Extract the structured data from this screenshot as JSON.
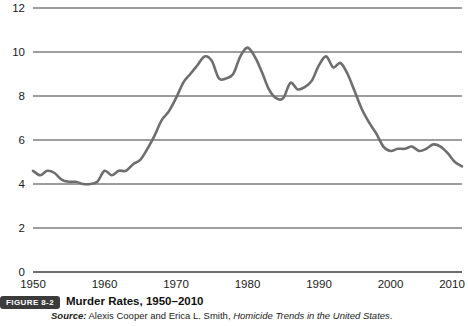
{
  "figure": {
    "badge": "FIGURE 8-2",
    "title": "Murder Rates, 1950–2010",
    "source_label": "Source:",
    "source_authors": " Alexis Cooper and Erica L. Smith, ",
    "source_publication": "Homicide Trends in the United States",
    "source_end": "."
  },
  "colors": {
    "line": "#6e6e6e",
    "axis": "#3c3c3c",
    "grid": "#3c3c3c",
    "text": "#1a1a1a",
    "badge_bg": "#3b3b3b",
    "badge_fg": "#ffffff",
    "background": "#ffffff"
  },
  "chart_data": {
    "type": "line",
    "title": "Murder Rates, 1950–2010",
    "xlabel": "",
    "ylabel": "",
    "xlim": [
      1950,
      2010
    ],
    "ylim": [
      0,
      12
    ],
    "grid": true,
    "legend": "none",
    "ytick_labels": [
      "0",
      "2",
      "4",
      "6",
      "8",
      "10",
      "12"
    ],
    "yticks": [
      0,
      2,
      4,
      6,
      8,
      10,
      12
    ],
    "xtick_labels": [
      "1950",
      "1960",
      "1970",
      "1980",
      "1990",
      "2000",
      "2010"
    ],
    "xticks": [
      1950,
      1960,
      1970,
      1980,
      1990,
      2000,
      2010
    ],
    "series": [
      {
        "name": "Murder rate per 100,000",
        "x": [
          1950,
          1951,
          1952,
          1953,
          1954,
          1955,
          1956,
          1957,
          1958,
          1959,
          1960,
          1961,
          1962,
          1963,
          1964,
          1965,
          1966,
          1967,
          1968,
          1969,
          1970,
          1971,
          1972,
          1973,
          1974,
          1975,
          1976,
          1977,
          1978,
          1979,
          1980,
          1981,
          1982,
          1983,
          1984,
          1985,
          1986,
          1987,
          1988,
          1989,
          1990,
          1991,
          1992,
          1993,
          1994,
          1995,
          1996,
          1997,
          1998,
          1999,
          2000,
          2001,
          2002,
          2003,
          2004,
          2005,
          2006,
          2007,
          2008,
          2009,
          2010
        ],
        "values": [
          4.6,
          4.4,
          4.6,
          4.5,
          4.2,
          4.1,
          4.1,
          4.0,
          4.0,
          4.1,
          4.6,
          4.4,
          4.6,
          4.6,
          4.9,
          5.1,
          5.6,
          6.2,
          6.9,
          7.3,
          7.9,
          8.6,
          9.0,
          9.4,
          9.8,
          9.6,
          8.8,
          8.8,
          9.0,
          9.8,
          10.2,
          9.8,
          9.1,
          8.3,
          7.9,
          7.9,
          8.6,
          8.3,
          8.4,
          8.7,
          9.4,
          9.8,
          9.3,
          9.5,
          9.0,
          8.2,
          7.4,
          6.8,
          6.3,
          5.7,
          5.5,
          5.6,
          5.6,
          5.7,
          5.5,
          5.6,
          5.8,
          5.7,
          5.4,
          5.0,
          4.8
        ]
      }
    ]
  }
}
